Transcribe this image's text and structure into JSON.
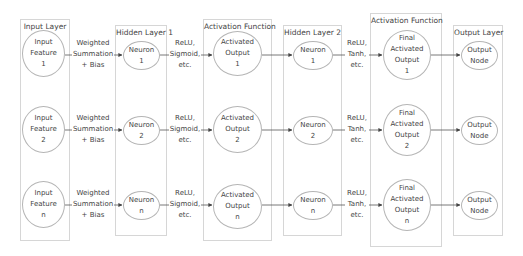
{
  "layers": [
    {
      "title": "Input Layer"
    },
    {
      "title": "Hidden Layer 1"
    },
    {
      "title": "Activation Function"
    },
    {
      "title": "Hidden Layer 2"
    },
    {
      "title": "Activation Function"
    },
    {
      "title": "Output Layer"
    }
  ],
  "rows": [
    {
      "input": "Input\nFeature\n1",
      "hidden1": "Neuron\n1",
      "act1": "Activated\nOutput\n1",
      "hidden2": "Neuron\n1",
      "act2": "Final\nActivated\nOutput\n1",
      "output": "Output\nNode"
    },
    {
      "input": "Input\nFeature\n2",
      "hidden1": "Neuron\n2",
      "act1": "Activated\nOutput\n2",
      "hidden2": "Neuron\n2",
      "act2": "Final\nActivated\nOutput\n2",
      "output": "Output\nNode"
    },
    {
      "input": "Input\nFeature\nn",
      "hidden1": "Neuron\nn",
      "act1": "Activated\nOutput\nn",
      "hidden2": "Neuron\nn",
      "act2": "Final\nActivated\nOutput\nn",
      "output": "Output\nNode"
    }
  ],
  "edge_labels": {
    "input_to_hidden1": "Weighted\nSummation\n+ Bias",
    "hidden1_to_act1": "ReLU,\nSigmoid,\netc.",
    "hidden2_to_act2": "ReLU,\nTanh,\netc."
  },
  "colors": {
    "border": "#d6d6d6",
    "node_border": "#b5b5b5",
    "edge": "#444444",
    "text": "#444444"
  }
}
